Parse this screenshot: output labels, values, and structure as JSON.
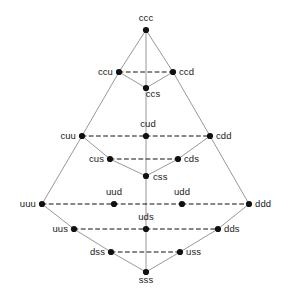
{
  "figure": {
    "kind": "weight-diagram",
    "width": 292,
    "height": 301,
    "background": "#ffffff",
    "node_color": "#111111",
    "node_radius": 3.1,
    "solid_edge_color": "#8c8c8c",
    "dashed_edge_color": "#111111",
    "label_color": "#1a1a1a"
  },
  "chart_data": {
    "type": "scatter",
    "title": "",
    "xlabel": "",
    "ylabel": "",
    "grid": false,
    "legend": null,
    "xlim": [
      0,
      292
    ],
    "ylim": [
      301,
      0
    ],
    "nodes": [
      {
        "id": "ccc",
        "label": "ccc",
        "x": 146,
        "y": 30,
        "label_pos": "above",
        "lx": 146,
        "ly": 23
      },
      {
        "id": "ccu",
        "label": "ccu",
        "x": 119,
        "y": 72,
        "label_pos": "left",
        "lx": 113,
        "ly": 72
      },
      {
        "id": "ccd",
        "label": "ccd",
        "x": 173,
        "y": 72,
        "label_pos": "right",
        "lx": 179,
        "ly": 72
      },
      {
        "id": "ccs",
        "label": "ccs",
        "x": 146,
        "y": 88,
        "label_pos": "below",
        "lx": 153,
        "ly": 89
      },
      {
        "id": "cuu",
        "label": "cuu",
        "x": 82,
        "y": 136,
        "label_pos": "left",
        "lx": 76,
        "ly": 136
      },
      {
        "id": "cud",
        "label": "cud",
        "x": 146,
        "y": 136,
        "label_pos": "above",
        "lx": 148,
        "ly": 129
      },
      {
        "id": "cdd",
        "label": "cdd",
        "x": 210,
        "y": 136,
        "label_pos": "right",
        "lx": 216,
        "ly": 136
      },
      {
        "id": "cus",
        "label": "cus",
        "x": 110,
        "y": 159,
        "label_pos": "left",
        "lx": 104,
        "ly": 159
      },
      {
        "id": "cds",
        "label": "cds",
        "x": 178,
        "y": 159,
        "label_pos": "right",
        "lx": 184,
        "ly": 159
      },
      {
        "id": "css",
        "label": "css",
        "x": 146,
        "y": 176,
        "label_pos": "right",
        "lx": 153,
        "ly": 177
      },
      {
        "id": "uuu",
        "label": "uuu",
        "x": 42,
        "y": 204,
        "label_pos": "left",
        "lx": 36,
        "ly": 204
      },
      {
        "id": "uud",
        "label": "uud",
        "x": 114,
        "y": 204,
        "label_pos": "above",
        "lx": 114,
        "ly": 197
      },
      {
        "id": "udd",
        "label": "udd",
        "x": 182,
        "y": 204,
        "label_pos": "above",
        "lx": 182,
        "ly": 197
      },
      {
        "id": "ddd",
        "label": "ddd",
        "x": 249,
        "y": 204,
        "label_pos": "right",
        "lx": 255,
        "ly": 204
      },
      {
        "id": "uus",
        "label": "uus",
        "x": 74,
        "y": 229,
        "label_pos": "left",
        "lx": 68,
        "ly": 229
      },
      {
        "id": "uds",
        "label": "uds",
        "x": 146,
        "y": 229,
        "label_pos": "above",
        "lx": 146,
        "ly": 222
      },
      {
        "id": "dds",
        "label": "dds",
        "x": 218,
        "y": 229,
        "label_pos": "right",
        "lx": 224,
        "ly": 229
      },
      {
        "id": "dss",
        "label": "dss",
        "x": 111,
        "y": 252,
        "label_pos": "left",
        "lx": 105,
        "ly": 252
      },
      {
        "id": "uss",
        "label": "uss",
        "x": 180,
        "y": 252,
        "label_pos": "right",
        "lx": 186,
        "ly": 252
      },
      {
        "id": "sss",
        "label": "sss",
        "x": 146,
        "y": 272,
        "label_pos": "below",
        "lx": 146,
        "ly": 275
      }
    ],
    "solid_edges": [
      [
        "ccc",
        "ccu"
      ],
      [
        "ccu",
        "cuu"
      ],
      [
        "cuu",
        "uuu"
      ],
      [
        "ccc",
        "ccd"
      ],
      [
        "ccd",
        "cdd"
      ],
      [
        "cdd",
        "ddd"
      ],
      [
        "uuu",
        "uus"
      ],
      [
        "uus",
        "dss"
      ],
      [
        "dss",
        "sss"
      ],
      [
        "ddd",
        "dds"
      ],
      [
        "dds",
        "uss"
      ],
      [
        "uss",
        "sss"
      ],
      [
        "ccc",
        "ccs"
      ],
      [
        "ccs",
        "cud"
      ],
      [
        "cud",
        "css"
      ],
      [
        "css",
        "uds"
      ],
      [
        "uds",
        "sss"
      ],
      [
        "ccu",
        "ccs"
      ],
      [
        "ccd",
        "ccs"
      ],
      [
        "cuu",
        "cus"
      ],
      [
        "cus",
        "css"
      ],
      [
        "cdd",
        "cds"
      ],
      [
        "cds",
        "css"
      ]
    ],
    "dashed_edges": [
      [
        "ccu",
        "ccd"
      ],
      [
        "cuu",
        "cud"
      ],
      [
        "cud",
        "cdd"
      ],
      [
        "cus",
        "cds"
      ],
      [
        "uuu",
        "uud"
      ],
      [
        "uud",
        "udd"
      ],
      [
        "udd",
        "ddd"
      ],
      [
        "uus",
        "uds"
      ],
      [
        "uds",
        "dds"
      ],
      [
        "dss",
        "uss"
      ]
    ]
  }
}
